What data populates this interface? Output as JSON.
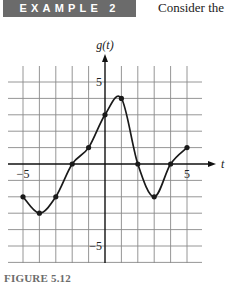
{
  "header": {
    "badge": "EXAMPLE 2",
    "intro_text": "Consider the"
  },
  "caption": "FIGURE 5.12",
  "chart_data": {
    "type": "line",
    "title": "",
    "xlabel": "t",
    "ylabel": "g(t)",
    "xlim": [
      -5.9,
      5.9
    ],
    "ylim": [
      -6,
      6
    ],
    "grid": true,
    "tick_labels": {
      "x": [
        {
          "value": -5,
          "label": "−5"
        },
        {
          "value": 5,
          "label": "5"
        }
      ],
      "y": [
        {
          "value": 5,
          "label": "5"
        },
        {
          "value": -5,
          "label": "−5"
        }
      ]
    },
    "series": [
      {
        "name": "g(t)",
        "x": [
          -5,
          -4,
          -3,
          -2,
          -1,
          0,
          1,
          2,
          3,
          4,
          5
        ],
        "values": [
          -2,
          -3,
          -2,
          0,
          1,
          3,
          4,
          0,
          -2,
          0,
          1
        ]
      }
    ],
    "marked_points": [
      [
        -5,
        -2
      ],
      [
        -4,
        -3
      ],
      [
        -3,
        -2
      ],
      [
        -2,
        0
      ],
      [
        -1,
        1
      ],
      [
        0,
        3
      ],
      [
        1,
        4
      ],
      [
        2,
        0
      ],
      [
        3,
        -2
      ],
      [
        4,
        0
      ],
      [
        5,
        1
      ]
    ]
  }
}
